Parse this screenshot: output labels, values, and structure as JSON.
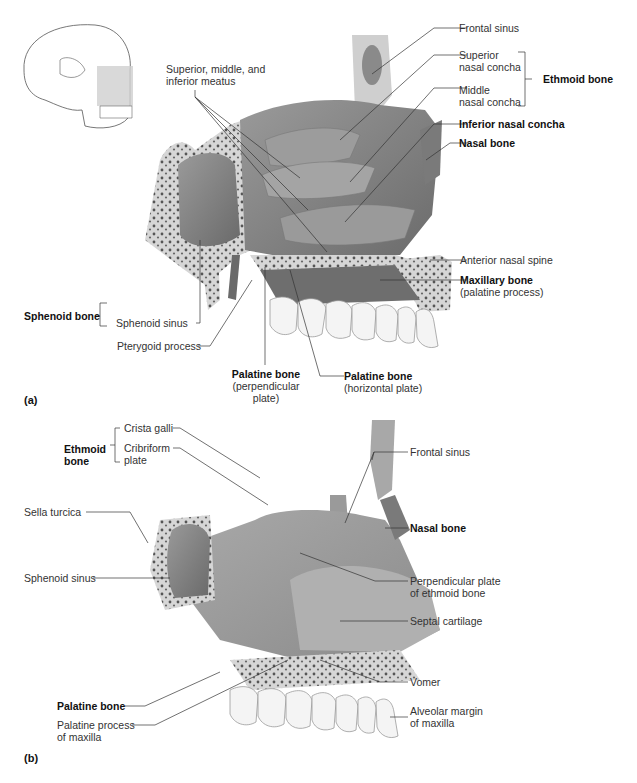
{
  "figure": {
    "panels": [
      {
        "id": "a",
        "tag": "(a)",
        "orientation_inset": "skull-lateral-view-with-highlighted-nasal-region",
        "labels": {
          "meatus": [
            "Superior, middle, and",
            "inferior meatus"
          ],
          "frontal_sinus": "Frontal sinus",
          "superior_concha": [
            "Superior",
            "nasal concha"
          ],
          "middle_concha": [
            "Middle",
            "nasal concha"
          ],
          "ethmoid_bone": "Ethmoid bone",
          "inferior_concha": "Inferior nasal concha",
          "nasal_bone": "Nasal bone",
          "anterior_nasal_spine": "Anterior nasal spine",
          "maxillary_bone": "Maxillary bone",
          "maxillary_sub": "(palatine process)",
          "sphenoid_bone": "Sphenoid bone",
          "sphenoid_sinus": "Sphenoid sinus",
          "pterygoid_process": "Pterygoid process",
          "palatine_perp": "Palatine bone",
          "palatine_perp_sub": [
            "(perpendicular",
            "plate)"
          ],
          "palatine_horiz": "Palatine bone",
          "palatine_horiz_sub": "(horizontal plate)"
        }
      },
      {
        "id": "b",
        "tag": "(b)",
        "labels": {
          "ethmoid_bone": [
            "Ethmoid",
            "bone"
          ],
          "crista_galli": "Crista galli",
          "cribriform": [
            "Cribriform",
            "plate"
          ],
          "frontal_sinus": "Frontal sinus",
          "sella_turcica": "Sella turcica",
          "nasal_bone": "Nasal bone",
          "sphenoid_sinus": "Sphenoid sinus",
          "perp_plate": [
            "Perpendicular plate",
            "of ethmoid bone"
          ],
          "septal_cartilage": "Septal cartilage",
          "vomer": "Vomer",
          "palatine_bone": "Palatine bone",
          "alveolar_margin": [
            "Alveolar margin",
            "of maxilla"
          ],
          "palatine_process": [
            "Palatine process",
            "of maxilla"
          ]
        }
      }
    ],
    "colors": {
      "bone_dark": "#6e6e6e",
      "bone_mid": "#8c8c8c",
      "bone_light": "#b4b4b4",
      "spongy_bone": "#d6d6d6",
      "teeth": "#f2f2f2",
      "leader_line": "#333333"
    }
  }
}
